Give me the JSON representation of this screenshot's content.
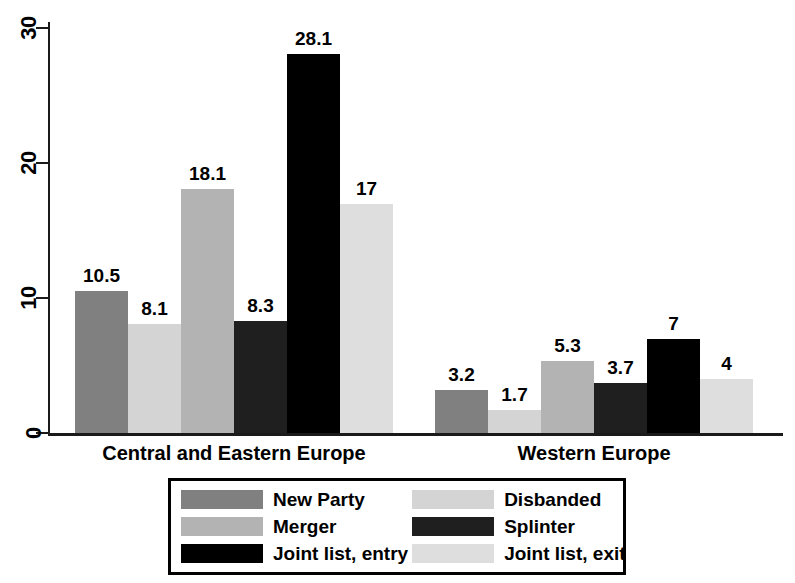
{
  "chart_data": {
    "type": "bar",
    "title": "",
    "subtitle": "",
    "xlabel": "",
    "ylabel": "",
    "categories": [
      "Central and Eastern Europe",
      "Western Europe"
    ],
    "series": [
      {
        "name": "New Party",
        "color": "#808080",
        "values": [
          10.5,
          3.2
        ],
        "labels": [
          "10.5",
          "3.2"
        ]
      },
      {
        "name": "Disbanded",
        "color": "#d4d4d4",
        "values": [
          8.1,
          1.7
        ],
        "labels": [
          "8.1",
          "1.7"
        ]
      },
      {
        "name": "Merger",
        "color": "#b3b3b3",
        "values": [
          18.1,
          5.3
        ],
        "labels": [
          "18.1",
          "5.3"
        ]
      },
      {
        "name": "Splinter",
        "color": "#1f1f1f",
        "values": [
          8.3,
          3.7
        ],
        "labels": [
          "8.3",
          "3.7"
        ]
      },
      {
        "name": "Joint list, entry",
        "color": "#000000",
        "values": [
          28.1,
          7
        ],
        "labels": [
          "28.1",
          "7"
        ]
      },
      {
        "name": "Joint list, exit",
        "color": "#dedede",
        "values": [
          17,
          4
        ],
        "labels": [
          "17",
          "4"
        ]
      }
    ],
    "ylim": [
      0,
      31
    ],
    "yticks": [
      0,
      10,
      20,
      30
    ],
    "ytick_labels": [
      "0",
      "10",
      "20",
      "30"
    ],
    "grid": false,
    "legend_position": "bottom",
    "legend_order": [
      "New Party",
      "Disbanded",
      "Merger",
      "Splinter",
      "Joint list, entry",
      "Joint list, exit"
    ],
    "axis_color": "#1a1a1a",
    "background": "#ffffff"
  },
  "axis": {
    "ticks": [
      {
        "label": "30",
        "value": 30
      },
      {
        "label": "20",
        "value": 20
      },
      {
        "label": "10",
        "value": 10
      },
      {
        "label": "0",
        "value": 0
      }
    ]
  },
  "groups": [
    {
      "label": "Central and Eastern Europe",
      "bars": [
        {
          "series": "New Party",
          "label": "10.5",
          "value": 10.5,
          "color": "#808080"
        },
        {
          "series": "Disbanded",
          "label": "8.1",
          "value": 8.1,
          "color": "#d4d4d4"
        },
        {
          "series": "Merger",
          "label": "18.1",
          "value": 18.1,
          "color": "#b3b3b3"
        },
        {
          "series": "Splinter",
          "label": "8.3",
          "value": 8.3,
          "color": "#1f1f1f"
        },
        {
          "series": "Joint list, entry",
          "label": "28.1",
          "value": 28.1,
          "color": "#000000"
        },
        {
          "series": "Joint list, exit",
          "label": "17",
          "value": 17,
          "color": "#dedede"
        }
      ]
    },
    {
      "label": "Western Europe",
      "bars": [
        {
          "series": "New Party",
          "label": "3.2",
          "value": 3.2,
          "color": "#808080"
        },
        {
          "series": "Disbanded",
          "label": "1.7",
          "value": 1.7,
          "color": "#d4d4d4"
        },
        {
          "series": "Merger",
          "label": "5.3",
          "value": 5.3,
          "color": "#b3b3b3"
        },
        {
          "series": "Splinter",
          "label": "3.7",
          "value": 3.7,
          "color": "#1f1f1f"
        },
        {
          "series": "Joint list, entry",
          "label": "7",
          "value": 7,
          "color": "#000000"
        },
        {
          "series": "Joint list, exit",
          "label": "4",
          "value": 4,
          "color": "#dedede"
        }
      ]
    }
  ],
  "legend": {
    "items": [
      {
        "label": "New Party",
        "color": "#808080"
      },
      {
        "label": "Disbanded",
        "color": "#d4d4d4"
      },
      {
        "label": "Merger",
        "color": "#b3b3b3"
      },
      {
        "label": "Splinter",
        "color": "#1f1f1f"
      },
      {
        "label": "Joint list, entry",
        "color": "#000000"
      },
      {
        "label": "Joint list, exit",
        "color": "#dedede"
      }
    ]
  }
}
